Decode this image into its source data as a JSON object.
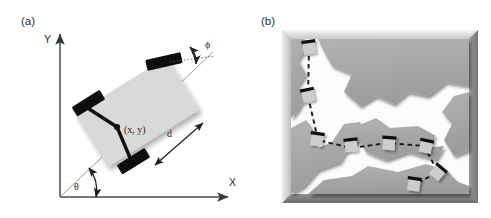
{
  "figure": {
    "caption_labels": {
      "panel_a": "(a)",
      "panel_b": "(b)"
    },
    "background_color": "#ffffff"
  },
  "panel_a": {
    "label": "(a)",
    "description": "Kinematic model of a car-like mobile robot in the plane",
    "axes": {
      "y_label": "Y",
      "x_label": "X",
      "axis_color": "#4a4a4a",
      "origin_px": [
        60,
        197
      ],
      "x_end_px": [
        232,
        197
      ],
      "y_end_px": [
        60,
        28
      ]
    },
    "annotations": [
      {
        "name": "heading-angle",
        "symbol": "θ",
        "description": "angle between X axis and robot longitudinal axis"
      },
      {
        "name": "steering-angle",
        "symbol": "ϕ",
        "description": "steering angle of front wheels relative to body axis"
      },
      {
        "name": "wheelbase",
        "symbol": "d",
        "description": "distance between rear axle and front axle"
      },
      {
        "name": "reference-point",
        "symbol": "(x, y)",
        "description": "robot reference point at center of rear axle"
      }
    ],
    "colors": {
      "body_fill": "#d9d9d9",
      "wheel_fill": "#0d0d0d",
      "axle_color": "#0d0d0d",
      "guide_line": "#808080",
      "text": "#2b2b2b"
    },
    "geometry": {
      "body_angle_deg": -32,
      "steering_angle_deg": 20,
      "body_center_px": [
        137,
        112
      ],
      "body_width_px": 108,
      "body_height_px": 62
    }
  },
  "panel_b": {
    "label": "(b)",
    "description": "Planned collision-free path of the car-like robot through a polygonal workspace, shown as a dashed trajectory with sampled robot poses",
    "frame": {
      "x_px": 282,
      "y_px": 30,
      "width_px": 196,
      "height_px": 173,
      "bevel": true
    },
    "colors": {
      "obstacle_fill": "#a8a8a8",
      "free_space_fill": "#fefefe",
      "bevel_light": "#f2f2f2",
      "bevel_dark": "#787878",
      "path_color": "#1a1a1a",
      "robot_body_fill": "#cdcdcd",
      "robot_wheel_fill": "#111111"
    },
    "path": {
      "style": "dashed",
      "num_robot_poses": 9,
      "waypoints": [
        [
          303,
          48
        ],
        [
          302,
          96
        ],
        [
          312,
          140
        ],
        [
          345,
          148
        ],
        [
          382,
          143
        ],
        [
          418,
          146
        ],
        [
          432,
          172
        ],
        [
          410,
          184
        ]
      ]
    },
    "robot_poses": [
      {
        "cx": 303,
        "cy": 47,
        "angle": -8
      },
      {
        "cx": 302,
        "cy": 95,
        "angle": -12
      },
      {
        "cx": 311,
        "cy": 139,
        "angle": 8
      },
      {
        "cx": 345,
        "cy": 145,
        "angle": -6
      },
      {
        "cx": 383,
        "cy": 143,
        "angle": 4
      },
      {
        "cx": 420,
        "cy": 146,
        "angle": 12
      },
      {
        "cx": 432,
        "cy": 172,
        "angle": 40
      },
      {
        "cx": 408,
        "cy": 184,
        "angle": 8
      }
    ]
  }
}
